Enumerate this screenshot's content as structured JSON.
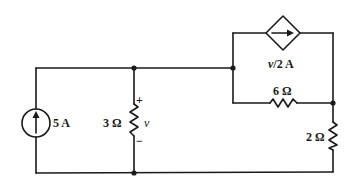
{
  "diagram": {
    "type": "electrical-circuit",
    "components": {
      "current_source": {
        "label": "5 A",
        "kind": "independent-current-source",
        "direction": "up"
      },
      "resistor_3": {
        "label": "3 Ω",
        "voltage_label": "v",
        "plus": "+",
        "minus": "−"
      },
      "dependent_source": {
        "label": "v/2 A",
        "kind": "dependent-current-source",
        "direction": "right"
      },
      "resistor_6": {
        "label": "6 Ω"
      },
      "resistor_2": {
        "label": "2 Ω"
      }
    }
  }
}
